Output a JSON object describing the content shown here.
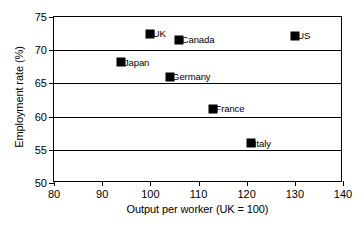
{
  "chart_data": {
    "type": "scatter",
    "title": "",
    "xlabel": "Output per worker (UK = 100)",
    "ylabel": "Employment rate (%)",
    "xlim": [
      80,
      140
    ],
    "ylim": [
      50,
      75
    ],
    "xticks": [
      80,
      90,
      100,
      110,
      120,
      130,
      140
    ],
    "yticks": [
      50,
      55,
      60,
      65,
      70,
      75
    ],
    "grid": "horizontal",
    "legend": "none",
    "marker": {
      "shape": "square",
      "color": "#000000",
      "size_px": 9
    },
    "points": [
      {
        "label": "UK",
        "x": 100,
        "y": 72.5,
        "label_side": "right"
      },
      {
        "label": "Canada",
        "x": 106,
        "y": 71.6,
        "label_side": "right"
      },
      {
        "label": "US",
        "x": 130,
        "y": 72.2,
        "label_side": "right"
      },
      {
        "label": "Japan",
        "x": 94,
        "y": 68.2,
        "label_side": "right"
      },
      {
        "label": "Germany",
        "x": 104,
        "y": 66.0,
        "label_side": "right"
      },
      {
        "label": "France",
        "x": 113,
        "y": 61.2,
        "label_side": "right"
      },
      {
        "label": "Italy",
        "x": 121,
        "y": 56.0,
        "label_side": "right"
      }
    ]
  },
  "axes": {
    "x_tick_labels": [
      "80",
      "90",
      "100",
      "110",
      "120",
      "130",
      "140"
    ],
    "y_tick_labels": [
      "50",
      "55",
      "60",
      "65",
      "70",
      "75"
    ]
  },
  "colors": {
    "marker": "#000000",
    "axis": "#000000",
    "grid": "#000000",
    "background": "#ffffff"
  }
}
